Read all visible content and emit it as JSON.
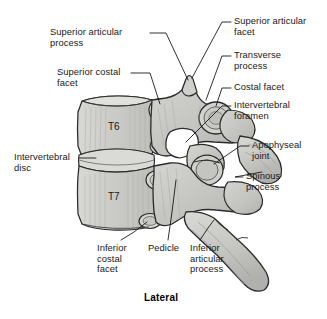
{
  "figure": {
    "caption": "Lateral",
    "view_title": "Lateral",
    "colors": {
      "background": "#ffffff",
      "bone_fill": "#c9c9c6",
      "bone_fill_light": "#dcdcd8",
      "bone_fill_dark": "#b4b4b0",
      "outline": "#2b2b2b",
      "leader_line": "#1a1a1a",
      "text": "#1a1a1a",
      "hatch": "#a8a8a4",
      "foramen_white": "#ffffff"
    }
  },
  "vertebrae": [
    {
      "id": "T6",
      "name": "sixth thoracic vertebra"
    },
    {
      "id": "T7",
      "name": "seventh thoracic vertebra"
    }
  ],
  "labels": {
    "superior_articular_process": "Superior articular\nprocess",
    "superior_costal_facet": "Superior costal\nfacet",
    "intervertebral_disc": "Intervertebral\ndisc",
    "superior_articular_facet": "Superior articular\nfacet",
    "transverse_process": "Transverse\nprocess",
    "costal_facet": "Costal facet",
    "intervertebral_foramen": "Intervertebral\nforamen",
    "apophyseal_joint": "Apophyseal\njoint",
    "spinous_process": "Spinous\nprocess",
    "inferior_costal_facet": "Inferior\ncostal\nfacet",
    "pedicle": "Pedicle",
    "inferior_articular_process": "Inferior\narticular\nprocess"
  }
}
